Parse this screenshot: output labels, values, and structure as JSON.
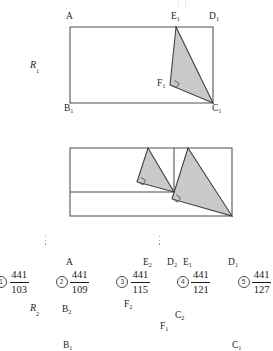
{
  "document": {
    "type": "geometry-multiple-choice-figure",
    "shade_color": "#c9c9c9",
    "stroke_color": "#4d4d4d"
  },
  "figure1": {
    "name": "R1",
    "figure_label": "R",
    "figure_label_sub": "1",
    "vertices": [
      {
        "id": "A",
        "label": "A",
        "sub": "",
        "x": 70,
        "y": 27
      },
      {
        "id": "D1",
        "label": "D",
        "sub": "1",
        "x": 213,
        "y": 27
      },
      {
        "id": "B1",
        "label": "B",
        "sub": "1",
        "x": 70,
        "y": 103
      },
      {
        "id": "C1",
        "label": "C",
        "sub": "1",
        "x": 213,
        "y": 103
      },
      {
        "id": "E1",
        "label": "E",
        "sub": "1",
        "x": 176,
        "y": 27
      },
      {
        "id": "F1",
        "label": "F",
        "sub": "1",
        "x": 170,
        "y": 85
      }
    ],
    "shaded_triangle": "E1-F1-C1",
    "right_angle_at": "F1"
  },
  "figure2": {
    "name": "R2",
    "figure_label": "R",
    "figure_label_sub": "2",
    "vertices": [
      {
        "id": "A",
        "label": "A",
        "sub": "",
        "x": 70,
        "y": 148
      },
      {
        "id": "E2",
        "label": "E",
        "sub": "2",
        "x": 148,
        "y": 148
      },
      {
        "id": "D2",
        "label": "D",
        "sub": "2",
        "x": 174,
        "y": 148
      },
      {
        "id": "E1",
        "label": "E",
        "sub": "1",
        "x": 188,
        "y": 148
      },
      {
        "id": "D1",
        "label": "D",
        "sub": "1",
        "x": 232,
        "y": 148
      },
      {
        "id": "B2",
        "label": "B",
        "sub": "2",
        "x": 70,
        "y": 192
      },
      {
        "id": "C2",
        "label": "C",
        "sub": "2",
        "x": 174,
        "y": 192
      },
      {
        "id": "F2",
        "label": "F",
        "sub": "2",
        "x": 137,
        "y": 182
      },
      {
        "id": "F1",
        "label": "F",
        "sub": "1",
        "x": 172,
        "y": 199
      },
      {
        "id": "B1",
        "label": "B",
        "sub": "1",
        "x": 70,
        "y": 216
      },
      {
        "id": "C1",
        "label": "C",
        "sub": "1",
        "x": 232,
        "y": 216
      }
    ],
    "shaded_triangles": [
      "E2-F2-C2",
      "E1-F1-C1"
    ],
    "right_angles_at": [
      "F2",
      "F1"
    ]
  },
  "ellipses": [
    {
      "name": "ellipsis-left",
      "x": 44,
      "y": 236
    },
    {
      "name": "ellipsis-right",
      "x": 158,
      "y": 236
    }
  ],
  "choices": [
    {
      "number": "1",
      "numerator": "441",
      "denominator": "103"
    },
    {
      "number": "2",
      "numerator": "441",
      "denominator": "109"
    },
    {
      "number": "3",
      "numerator": "441",
      "denominator": "115"
    },
    {
      "number": "4",
      "numerator": "441",
      "denominator": "121"
    },
    {
      "number": "5",
      "numerator": "441",
      "denominator": "127"
    }
  ]
}
